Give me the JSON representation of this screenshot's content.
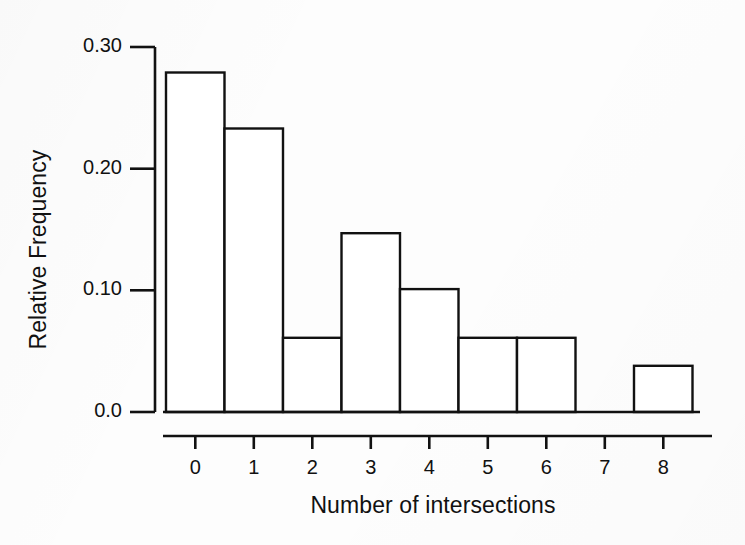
{
  "chart_data": {
    "type": "bar",
    "title": "",
    "xlabel": "Number of intersections",
    "ylabel": "Relative Frequency",
    "categories": [
      "0",
      "1",
      "2",
      "3",
      "4",
      "5",
      "6",
      "7",
      "8"
    ],
    "values": [
      0.279,
      0.233,
      0.061,
      0.147,
      0.101,
      0.061,
      0.061,
      0.0,
      0.038
    ],
    "xlim": [
      -0.5,
      8.5
    ],
    "ylim": [
      0.0,
      0.3
    ],
    "ytick_labels": [
      "0.0",
      "0.10",
      "0.20",
      "0.30"
    ],
    "ytick_values": [
      0.0,
      0.1,
      0.2,
      0.3
    ],
    "xtick_labels": [
      "0",
      "1",
      "2",
      "3",
      "4",
      "5",
      "6",
      "7",
      "8"
    ],
    "xtick_values": [
      0,
      1,
      2,
      3,
      4,
      5,
      6,
      7,
      8
    ],
    "grid": false,
    "legend": null,
    "bar_fill": "#ffffff",
    "bar_edge": "#111111",
    "axis_color": "#111111",
    "background": "#fdfdfd"
  },
  "figure": {
    "caption": ""
  }
}
